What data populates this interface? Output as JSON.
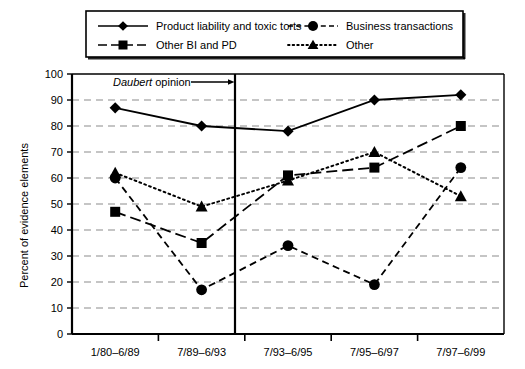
{
  "chart_data": {
    "type": "line",
    "title": "",
    "xlabel": "",
    "ylabel": "Percent of evidence elements",
    "ylim": [
      0,
      100
    ],
    "ytick_step": 10,
    "grid": true,
    "legend_position": "top",
    "categories": [
      "1/80–6/89",
      "7/89–6/93",
      "7/93–6/95",
      "7/95–6/97",
      "7/97–6/99"
    ],
    "series": [
      {
        "name": "Product liability and toxic torts",
        "marker": "diamond",
        "line": "solid",
        "values": [
          87,
          80,
          78,
          90,
          92
        ]
      },
      {
        "name": "Other BI and PD",
        "marker": "square",
        "line": "longdash",
        "values": [
          47,
          35,
          61,
          64,
          80
        ]
      },
      {
        "name": "Business transactions",
        "marker": "circle",
        "line": "dashed",
        "values": [
          60,
          17,
          34,
          19,
          64
        ]
      },
      {
        "name": "Other",
        "marker": "triangle",
        "line": "dotted",
        "values": [
          62,
          49,
          59,
          70,
          53
        ]
      }
    ],
    "annotations": [
      {
        "text_italic": "Daubert",
        "text_rest": " opinion",
        "type": "vertical-line-with-arrow",
        "between_categories": [
          2,
          3
        ]
      }
    ],
    "yticks": [
      "0",
      "10",
      "20",
      "30",
      "40",
      "50",
      "60",
      "70",
      "80",
      "90",
      "100"
    ]
  },
  "legend": {
    "entries": [
      {
        "label": "Product liability and toxic torts"
      },
      {
        "label": "Business transactions"
      },
      {
        "label": "Other BI and PD"
      },
      {
        "label": "Other"
      }
    ]
  },
  "axes": {
    "y_title": "Percent of evidence elements"
  },
  "annotation": {
    "daubert_italic": "Daubert",
    "daubert_rest": " opinion"
  },
  "colors": {
    "ink": "#000000",
    "grid": "#8c8c8c",
    "background": "#ffffff"
  }
}
